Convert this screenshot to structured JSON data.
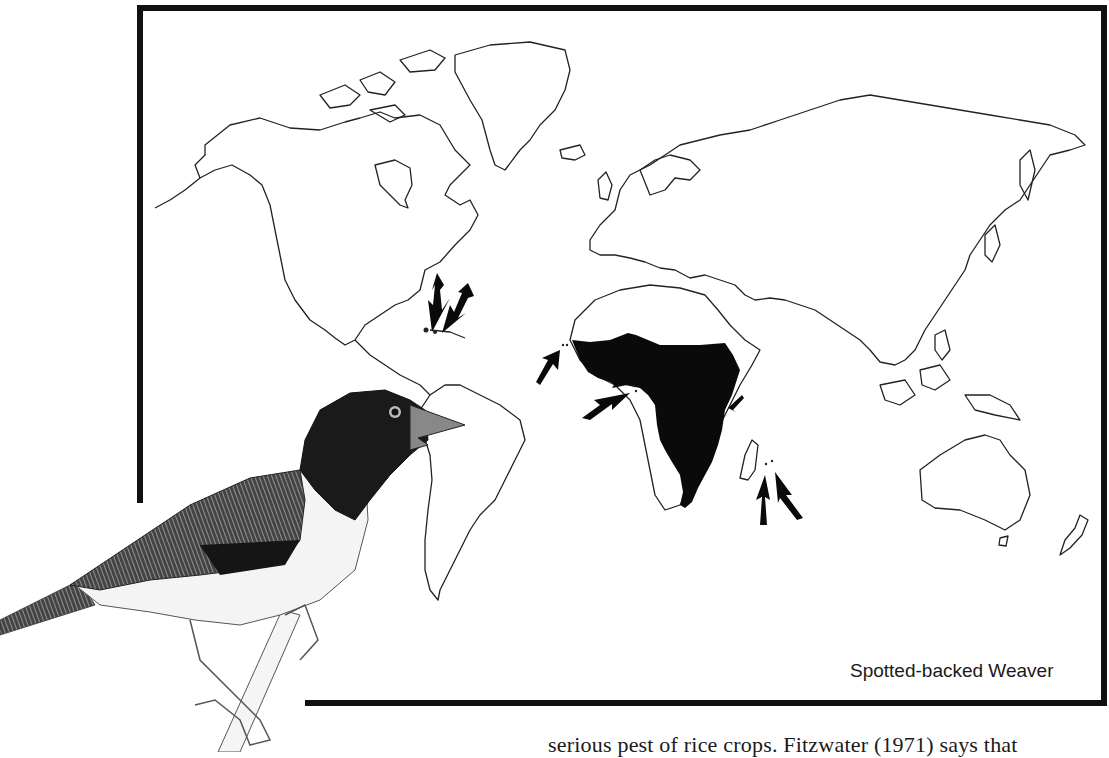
{
  "figure": {
    "caption": "Spotted-backed Weaver",
    "map_subject": "world distribution map",
    "native_range_region": "sub-Saharan Africa",
    "introduction_arrows": [
      {
        "target": "Hispaniola (Caribbean)",
        "count": 2
      },
      {
        "target": "West Africa coast islands",
        "count": 1
      },
      {
        "target": "Gulf of Guinea islands",
        "count": 2
      },
      {
        "target": "Zanzibar coast",
        "count": 1
      },
      {
        "target": "Mascarene Islands",
        "count": 2
      }
    ],
    "illustration": "Spotted-backed Weaver perched on branch"
  },
  "body_text": {
    "line": "serious pest of rice crops. Fitzwater (1971) says that"
  },
  "colors": {
    "ink": "#111111",
    "paper": "#ffffff"
  }
}
